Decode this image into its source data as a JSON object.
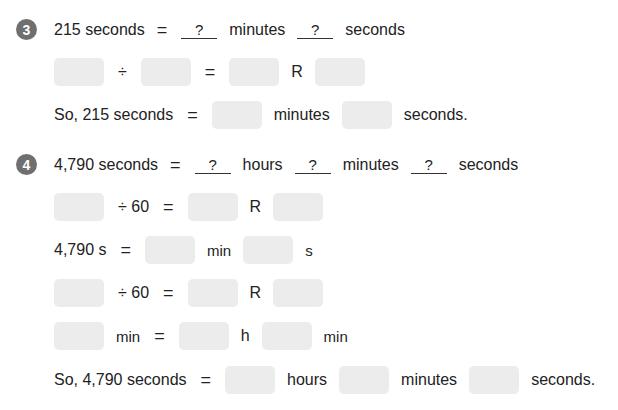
{
  "problem3": {
    "number": "3",
    "line1": {
      "lhs": "215 seconds",
      "eq": "=",
      "blank1": "?",
      "unit1": "minutes",
      "blank2": "?",
      "unit2": "seconds"
    },
    "line2": {
      "op": "÷",
      "eq": "=",
      "rem": "R"
    },
    "line3": {
      "prefix": "So, 215 seconds",
      "eq": "=",
      "unit1": "minutes",
      "unit2": "seconds."
    }
  },
  "problem4": {
    "number": "4",
    "line1": {
      "lhs": "4,790 seconds",
      "eq": "=",
      "blank1": "?",
      "unit1": "hours",
      "blank2": "?",
      "unit2": "minutes",
      "blank3": "?",
      "unit3": "seconds"
    },
    "line2": {
      "op": "÷ 60",
      "eq": "=",
      "rem": "R"
    },
    "line3": {
      "lhs": "4,790 s",
      "eq": "=",
      "unit1": "min",
      "unit2": "s"
    },
    "line4": {
      "op": "÷ 60",
      "eq": "=",
      "rem": "R"
    },
    "line5": {
      "unit0": "min",
      "eq": "=",
      "unit1": "h",
      "unit2": "min"
    },
    "line6": {
      "prefix": "So, 4,790 seconds",
      "eq": "=",
      "unit1": "hours",
      "unit2": "minutes",
      "unit3": "seconds."
    }
  }
}
